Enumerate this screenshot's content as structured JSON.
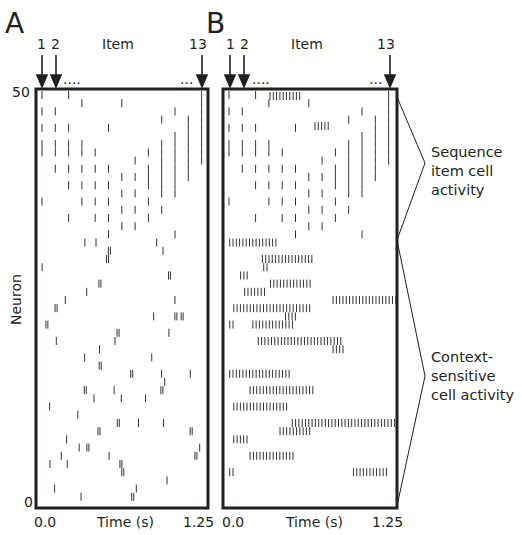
{
  "panels": {
    "A": {
      "letter": "A"
    },
    "B": {
      "letter": "B"
    }
  },
  "labels": {
    "item": "Item",
    "item_1": "1",
    "item_2": "2",
    "item_13": "13",
    "dots_left": "....",
    "dots_right": "...",
    "y_axis": "Neuron",
    "y_top": "50",
    "y_bottom": "0",
    "x_start": "0.0",
    "x_end": "1.25",
    "x_axis": "Time (s)"
  },
  "annotations": {
    "sequence": [
      "Sequence",
      "item cell",
      "activity"
    ],
    "context": [
      "Context-",
      "sensitive",
      "cell activity"
    ]
  },
  "colors": {
    "ink": "#231f20",
    "spike": "#333333"
  },
  "chart_data": [
    {
      "type": "scatter",
      "title": "A",
      "subtitle": "Spike raster, 50 neurons, sequence of 13 items",
      "xlabel": "Time (s)",
      "ylabel": "Neuron",
      "xlim": [
        0.0,
        1.25
      ],
      "ylim": [
        0,
        50
      ],
      "x_ticks": [
        "0.0",
        "1.25"
      ],
      "y_ticks": [
        "0",
        "50"
      ],
      "top_markers": [
        "1",
        "2",
        "....",
        "...",
        "13"
      ],
      "grid": false,
      "description": "Top ~18 neurons fire single spikes at item onsets forming a V/diagonal pattern; lower neurons fire sparse random spikes.",
      "sequence_cells": [
        {
          "neuron": 50,
          "items": [
            1,
            3,
            13
          ]
        },
        {
          "neuron": 49,
          "items": [
            4,
            7,
            13
          ]
        },
        {
          "neuron": 48,
          "items": [
            1,
            2,
            11,
            13
          ]
        },
        {
          "neuron": 47,
          "items": [
            10,
            12,
            13
          ]
        },
        {
          "neuron": 46,
          "items": [
            1,
            2,
            3,
            6,
            12,
            13
          ]
        },
        {
          "neuron": 45,
          "items": [
            11,
            12,
            13
          ]
        },
        {
          "neuron": 44,
          "items": [
            1,
            2,
            3,
            4,
            10,
            11,
            12,
            13
          ]
        },
        {
          "neuron": 43,
          "items": [
            1,
            2,
            3,
            4,
            5,
            9,
            10,
            11,
            12,
            13
          ]
        },
        {
          "neuron": 42,
          "items": [
            8,
            10,
            11,
            12,
            13
          ]
        },
        {
          "neuron": 41,
          "items": [
            2,
            3,
            4,
            5,
            6,
            9,
            10,
            11,
            12
          ]
        },
        {
          "neuron": 40,
          "items": [
            7,
            8,
            9,
            10,
            11,
            12
          ]
        },
        {
          "neuron": 39,
          "items": [
            3,
            4,
            5,
            6,
            9,
            10,
            11
          ]
        },
        {
          "neuron": 38,
          "items": [
            7,
            8,
            10,
            11
          ]
        },
        {
          "neuron": 37,
          "items": [
            1,
            4,
            5,
            6,
            9
          ]
        },
        {
          "neuron": 36,
          "items": [
            7,
            8,
            10
          ]
        },
        {
          "neuron": 35,
          "items": [
            3,
            5,
            6,
            9
          ]
        },
        {
          "neuron": 34,
          "items": [
            7,
            8
          ]
        },
        {
          "neuron": 33,
          "items": [
            6,
            11
          ]
        }
      ]
    },
    {
      "type": "scatter",
      "title": "B",
      "subtitle": "Spike raster, 50 neurons, sequence of 13 items",
      "xlabel": "Time (s)",
      "ylabel": "Neuron",
      "xlim": [
        0.0,
        1.25
      ],
      "ylim": [
        0,
        50
      ],
      "x_ticks": [
        "0.0",
        "1.25"
      ],
      "top_markers": [
        "1",
        "2",
        "....",
        "...",
        "13"
      ],
      "grid": false,
      "description": "Top neurons show sequence item cell activity (same pattern as A); lower neurons show sustained bursts (context-sensitive cell activity).",
      "regions": [
        {
          "label": "Sequence item cell activity",
          "neurons": [
            33,
            50
          ]
        },
        {
          "label": "Context-sensitive cell activity",
          "neurons": [
            0,
            32
          ]
        }
      ],
      "bursts": [
        {
          "neuron": 32,
          "t": [
            0.02,
            0.38
          ]
        },
        {
          "neuron": 30,
          "t": [
            0.26,
            0.63
          ]
        },
        {
          "neuron": 29,
          "t": [
            0.27,
            0.3
          ]
        },
        {
          "neuron": 28,
          "t": [
            0.1,
            0.17
          ]
        },
        {
          "neuron": 27,
          "t": [
            0.32,
            0.63
          ]
        },
        {
          "neuron": 26,
          "t": [
            0.13,
            0.29
          ]
        },
        {
          "neuron": 25,
          "t": [
            0.78,
            1.25
          ]
        },
        {
          "neuron": 24,
          "t": [
            0.05,
            0.61
          ]
        },
        {
          "neuron": 23,
          "t": [
            0.43,
            0.51
          ]
        },
        {
          "neuron": 22,
          "t": [
            0.02,
            0.05
          ]
        },
        {
          "neuron": 22,
          "t": [
            0.19,
            0.49
          ]
        },
        {
          "neuron": 20,
          "t": [
            0.23,
            0.84
          ]
        },
        {
          "neuron": 19,
          "t": [
            0.78,
            0.87
          ]
        },
        {
          "neuron": 16,
          "t": [
            0.02,
            0.47
          ]
        },
        {
          "neuron": 14,
          "t": [
            0.17,
            0.65
          ]
        },
        {
          "neuron": 12,
          "t": [
            0.05,
            0.44
          ]
        },
        {
          "neuron": 10,
          "t": [
            0.48,
            1.25
          ]
        },
        {
          "neuron": 9,
          "t": [
            0.39,
            0.61
          ]
        },
        {
          "neuron": 8,
          "t": [
            0.05,
            0.16
          ]
        },
        {
          "neuron": 6,
          "t": [
            0.17,
            0.49
          ]
        },
        {
          "neuron": 4,
          "t": [
            0.02,
            0.05
          ]
        },
        {
          "neuron": 4,
          "t": [
            0.93,
            1.19
          ]
        }
      ]
    }
  ]
}
